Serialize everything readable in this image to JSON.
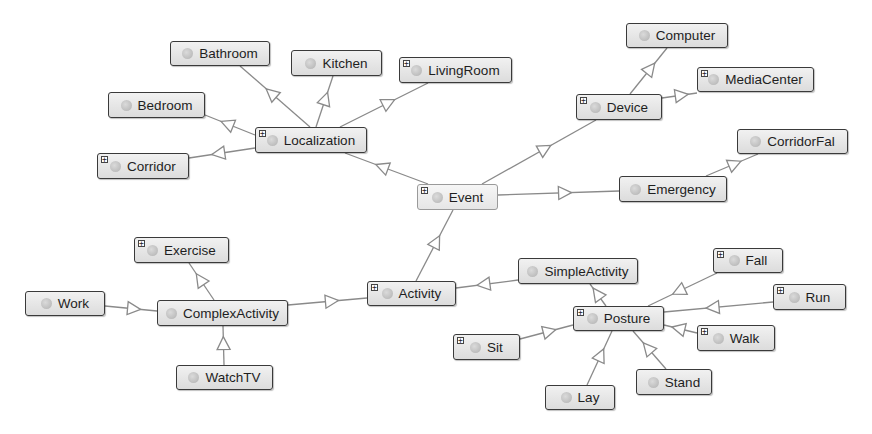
{
  "diagram": {
    "type": "ontology-class-graph",
    "colors": {
      "edge": "#8a8a8a",
      "node_border": "#3a3a3a",
      "node_fill": "#e6e6e6",
      "background": "#ffffff"
    },
    "nodes": [
      {
        "id": "Bathroom",
        "label": "Bathroom",
        "x": 170,
        "y": 41,
        "w": 100,
        "h": 25,
        "expandable": false
      },
      {
        "id": "Kitchen",
        "label": "Kitchen",
        "x": 291,
        "y": 50,
        "w": 91,
        "h": 26,
        "expandable": false
      },
      {
        "id": "LivingRoom",
        "label": "LivingRoom",
        "x": 399,
        "y": 57,
        "w": 113,
        "h": 26,
        "expandable": true
      },
      {
        "id": "Bedroom",
        "label": "Bedroom",
        "x": 108,
        "y": 92,
        "w": 97,
        "h": 26,
        "expandable": false
      },
      {
        "id": "Localization",
        "label": "Localization",
        "x": 255,
        "y": 127,
        "w": 112,
        "h": 26,
        "expandable": true
      },
      {
        "id": "Corridor",
        "label": "Corridor",
        "x": 97,
        "y": 153,
        "w": 92,
        "h": 26,
        "expandable": true
      },
      {
        "id": "Computer",
        "label": "Computer",
        "x": 626,
        "y": 23,
        "w": 102,
        "h": 25,
        "expandable": false
      },
      {
        "id": "MediaCenter",
        "label": "MediaCenter",
        "x": 697,
        "y": 67,
        "w": 117,
        "h": 25,
        "expandable": true
      },
      {
        "id": "Device",
        "label": "Device",
        "x": 576,
        "y": 94,
        "w": 86,
        "h": 26,
        "expandable": true
      },
      {
        "id": "CorridorFal",
        "label": "CorridorFal",
        "x": 737,
        "y": 129,
        "w": 111,
        "h": 25,
        "expandable": false
      },
      {
        "id": "Event",
        "label": "Event",
        "x": 417,
        "y": 184,
        "w": 81,
        "h": 26,
        "expandable": true,
        "selected": true
      },
      {
        "id": "Emergency",
        "label": "Emergency",
        "x": 619,
        "y": 176,
        "w": 108,
        "h": 26,
        "expandable": false
      },
      {
        "id": "Exercise",
        "label": "Exercise",
        "x": 134,
        "y": 237,
        "w": 95,
        "h": 26,
        "expandable": true
      },
      {
        "id": "Work",
        "label": "Work",
        "x": 25,
        "y": 291,
        "w": 80,
        "h": 25,
        "expandable": false
      },
      {
        "id": "ComplexActivity",
        "label": "ComplexActivity",
        "x": 157,
        "y": 300,
        "w": 131,
        "h": 26,
        "expandable": false
      },
      {
        "id": "WatchTV",
        "label": "WatchTV",
        "x": 176,
        "y": 365,
        "w": 97,
        "h": 25,
        "expandable": false
      },
      {
        "id": "Activity",
        "label": "Activity",
        "x": 367,
        "y": 281,
        "w": 89,
        "h": 25,
        "expandable": true
      },
      {
        "id": "SimpleActivity",
        "label": "SimpleActivity",
        "x": 518,
        "y": 258,
        "w": 120,
        "h": 26,
        "expandable": false
      },
      {
        "id": "Posture",
        "label": "Posture",
        "x": 573,
        "y": 306,
        "w": 91,
        "h": 25,
        "expandable": true
      },
      {
        "id": "Sit",
        "label": "Sit",
        "x": 453,
        "y": 334,
        "w": 67,
        "h": 26,
        "expandable": true
      },
      {
        "id": "Lay",
        "label": "Lay",
        "x": 545,
        "y": 385,
        "w": 70,
        "h": 25,
        "expandable": false
      },
      {
        "id": "Stand",
        "label": "Stand",
        "x": 636,
        "y": 369,
        "w": 76,
        "h": 26,
        "expandable": false
      },
      {
        "id": "Fall",
        "label": "Fall",
        "x": 713,
        "y": 248,
        "w": 70,
        "h": 25,
        "expandable": true
      },
      {
        "id": "Run",
        "label": "Run",
        "x": 773,
        "y": 284,
        "w": 73,
        "h": 26,
        "expandable": true
      },
      {
        "id": "Walk",
        "label": "Walk",
        "x": 697,
        "y": 325,
        "w": 78,
        "h": 26,
        "expandable": true
      }
    ],
    "edges": [
      {
        "from": "Localization",
        "to": "Bathroom",
        "x1": 310,
        "y1": 127,
        "x2": 240,
        "y2": 66
      },
      {
        "from": "Localization",
        "to": "Kitchen",
        "x1": 316,
        "y1": 127,
        "x2": 333,
        "y2": 76
      },
      {
        "from": "Localization",
        "to": "LivingRoom",
        "x1": 340,
        "y1": 127,
        "x2": 428,
        "y2": 83
      },
      {
        "from": "Localization",
        "to": "Bedroom",
        "x1": 255,
        "y1": 135,
        "x2": 205,
        "y2": 115
      },
      {
        "from": "Localization",
        "to": "Corridor",
        "x1": 255,
        "y1": 148,
        "x2": 189,
        "y2": 158
      },
      {
        "from": "Event",
        "to": "Localization",
        "x1": 428,
        "y1": 184,
        "x2": 345,
        "y2": 153
      },
      {
        "from": "Event",
        "to": "Device",
        "x1": 482,
        "y1": 184,
        "x2": 596,
        "y2": 120
      },
      {
        "from": "Event",
        "to": "Emergency",
        "x1": 498,
        "y1": 195,
        "x2": 619,
        "y2": 191
      },
      {
        "from": "Device",
        "to": "Computer",
        "x1": 630,
        "y1": 94,
        "x2": 667,
        "y2": 48
      },
      {
        "from": "Device",
        "to": "MediaCenter",
        "x1": 662,
        "y1": 98,
        "x2": 697,
        "y2": 93
      },
      {
        "from": "Emergency",
        "to": "CorridorFal",
        "x1": 706,
        "y1": 176,
        "x2": 758,
        "y2": 154
      },
      {
        "from": "Activity",
        "to": "Event",
        "x1": 416,
        "y1": 281,
        "x2": 453,
        "y2": 210
      },
      {
        "from": "ComplexActivity",
        "to": "Activity",
        "x1": 288,
        "y1": 305,
        "x2": 367,
        "y2": 298
      },
      {
        "from": "Exercise",
        "to": "ComplexActivity",
        "x1": 214,
        "y1": 300,
        "x2": 189,
        "y2": 263
      },
      {
        "from": "Work",
        "to": "ComplexActivity",
        "x1": 105,
        "y1": 306,
        "x2": 157,
        "y2": 311
      },
      {
        "from": "WatchTV",
        "to": "ComplexActivity",
        "x1": 224,
        "y1": 365,
        "x2": 223,
        "y2": 326
      },
      {
        "from": "SimpleActivity",
        "to": "Activity",
        "x1": 518,
        "y1": 280,
        "x2": 456,
        "y2": 288
      },
      {
        "from": "Posture",
        "to": "SimpleActivity",
        "x1": 606,
        "y1": 306,
        "x2": 590,
        "y2": 284
      },
      {
        "from": "Sit",
        "to": "Posture",
        "x1": 520,
        "y1": 339,
        "x2": 573,
        "y2": 325
      },
      {
        "from": "Lay",
        "to": "Posture",
        "x1": 587,
        "y1": 385,
        "x2": 612,
        "y2": 331
      },
      {
        "from": "Stand",
        "to": "Posture",
        "x1": 666,
        "y1": 369,
        "x2": 633,
        "y2": 331
      },
      {
        "from": "Fall",
        "to": "Posture",
        "x1": 717,
        "y1": 273,
        "x2": 648,
        "y2": 306
      },
      {
        "from": "Run",
        "to": "Posture",
        "x1": 773,
        "y1": 302,
        "x2": 664,
        "y2": 312
      },
      {
        "from": "Walk",
        "to": "Posture",
        "x1": 697,
        "y1": 333,
        "x2": 664,
        "y2": 325
      }
    ]
  }
}
